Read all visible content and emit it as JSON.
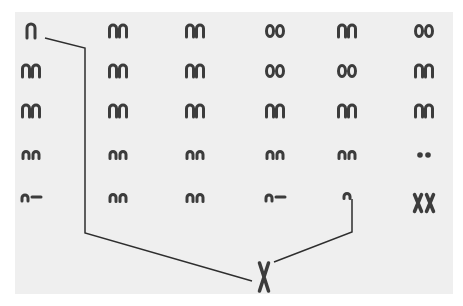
{
  "figure": {
    "type": "karyotype",
    "background_color": "#efefef",
    "chromosome_color": "#3c3c3c",
    "line_color": "#2e2e2e",
    "grid": {
      "columns_x": [
        31,
        118,
        195,
        275,
        347,
        424
      ],
      "rows_y": [
        31,
        71,
        111,
        153,
        196
      ]
    },
    "cells": [
      {
        "row": 0,
        "col": 0,
        "shape": "single-y",
        "label": "Y"
      },
      {
        "row": 0,
        "col": 1,
        "shape": "arch-pair"
      },
      {
        "row": 0,
        "col": 2,
        "shape": "arch-pair"
      },
      {
        "row": 0,
        "col": 3,
        "shape": "round-pair"
      },
      {
        "row": 0,
        "col": 4,
        "shape": "arch-pair"
      },
      {
        "row": 0,
        "col": 5,
        "shape": "round-pair"
      },
      {
        "row": 1,
        "col": 0,
        "shape": "arch-pair"
      },
      {
        "row": 1,
        "col": 1,
        "shape": "arch-pair"
      },
      {
        "row": 1,
        "col": 2,
        "shape": "arch-pair"
      },
      {
        "row": 1,
        "col": 3,
        "shape": "round-pair"
      },
      {
        "row": 1,
        "col": 4,
        "shape": "round-pair"
      },
      {
        "row": 1,
        "col": 5,
        "shape": "arch-pair"
      },
      {
        "row": 2,
        "col": 0,
        "shape": "arch-pair"
      },
      {
        "row": 2,
        "col": 1,
        "shape": "arch-pair"
      },
      {
        "row": 2,
        "col": 2,
        "shape": "arch-pair"
      },
      {
        "row": 2,
        "col": 3,
        "shape": "arch-pair"
      },
      {
        "row": 2,
        "col": 4,
        "shape": "arch-pair"
      },
      {
        "row": 2,
        "col": 5,
        "shape": "arch-pair"
      },
      {
        "row": 3,
        "col": 0,
        "shape": "small-pair"
      },
      {
        "row": 3,
        "col": 1,
        "shape": "small-pair"
      },
      {
        "row": 3,
        "col": 2,
        "shape": "small-pair"
      },
      {
        "row": 3,
        "col": 3,
        "shape": "small-pair"
      },
      {
        "row": 3,
        "col": 4,
        "shape": "small-pair"
      },
      {
        "row": 3,
        "col": 5,
        "shape": "dot-pair"
      },
      {
        "row": 4,
        "col": 0,
        "shape": "arch-dash"
      },
      {
        "row": 4,
        "col": 1,
        "shape": "small-pair"
      },
      {
        "row": 4,
        "col": 2,
        "shape": "small-pair"
      },
      {
        "row": 4,
        "col": 3,
        "shape": "arch-dash"
      },
      {
        "row": 4,
        "col": 4,
        "shape": "single-small"
      },
      {
        "row": 4,
        "col": 5,
        "shape": "x-pair",
        "label": "XX"
      }
    ],
    "bottom_chromosome": {
      "x": 264,
      "y": 277,
      "label": "X"
    },
    "connector_lines": [
      {
        "name": "left-connector",
        "points": [
          [
            45,
            38
          ],
          [
            85,
            48
          ],
          [
            85,
            233
          ],
          [
            252,
            281
          ]
        ]
      },
      {
        "name": "right-connector",
        "points": [
          [
            352,
            199
          ],
          [
            352,
            232
          ],
          [
            274,
            262
          ]
        ]
      }
    ]
  }
}
